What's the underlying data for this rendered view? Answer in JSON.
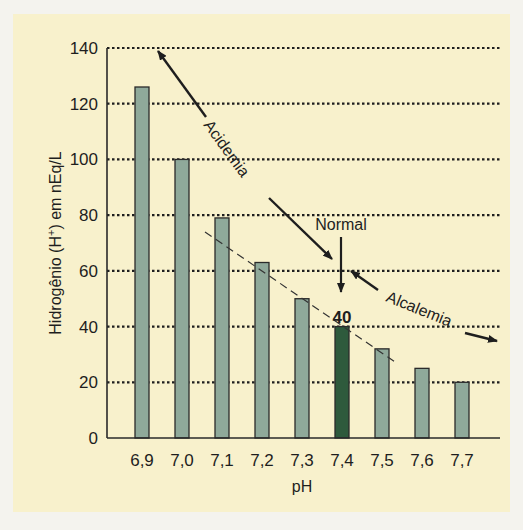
{
  "chart_data": {
    "type": "bar",
    "title": "",
    "xlabel": "pH",
    "ylabel": "Hidrogênio (H+) em nEq/L",
    "ylabel_parts": {
      "pre": "Hidrogênio (H",
      "sup": "+",
      "post": ") em nEq/L"
    },
    "categories": [
      "6,9",
      "7,0",
      "7,1",
      "7,2",
      "7,3",
      "7,4",
      "7,5",
      "7,6",
      "7,7"
    ],
    "values": [
      126,
      100,
      79,
      63,
      50,
      40,
      32,
      25,
      20
    ],
    "highlight_index": 5,
    "highlight_label": "40",
    "ylim": [
      0,
      140
    ],
    "yticks": [
      0,
      20,
      40,
      60,
      80,
      100,
      120,
      140
    ],
    "grid": "dotted horizontal",
    "colors": {
      "bar": "#8fa99a",
      "highlight": "#2e5a3c",
      "background": "#f8f1cc",
      "edge": "#2a2a2a"
    },
    "annotations": [
      {
        "text": "Acidemia",
        "type": "double-arrow",
        "direction": "toward low pH / high H+"
      },
      {
        "text": "Normal",
        "type": "arrow-down",
        "target": "7,4"
      },
      {
        "text": "Alcalemia",
        "type": "double-arrow",
        "direction": "toward high pH / low H+"
      },
      {
        "text": "",
        "type": "dashed-trend-line"
      }
    ]
  }
}
